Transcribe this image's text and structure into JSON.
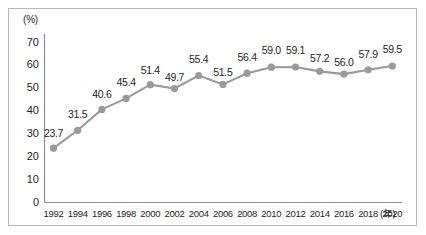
{
  "chart_data": {
    "type": "line",
    "title": "",
    "xlabel": "(年)",
    "ylabel": "(%)",
    "ylim": [
      0,
      70
    ],
    "ytick_labels": [
      "70",
      "60",
      "50",
      "40",
      "30",
      "20",
      "10",
      "0"
    ],
    "ytick_values": [
      70,
      60,
      50,
      40,
      30,
      20,
      10,
      0
    ],
    "grid": false,
    "legend": "none",
    "series_color": "#9a9a9a",
    "categories": [
      "1992",
      "1994",
      "1996",
      "1998",
      "2000",
      "2002",
      "2004",
      "2006",
      "2008",
      "2010",
      "2012",
      "2014",
      "2016",
      "2018",
      "2020"
    ],
    "values": [
      23.7,
      31.5,
      40.6,
      45.4,
      51.4,
      49.7,
      55.4,
      51.5,
      56.4,
      59.0,
      59.1,
      57.2,
      56.0,
      57.9,
      59.5
    ],
    "data_labels": [
      "23.7",
      "31.5",
      "40.6",
      "45.4",
      "51.4",
      "49.7",
      "55.4",
      "51.5",
      "56.4",
      "59.0",
      "59.1",
      "57.2",
      "56.0",
      "57.9",
      "59.5"
    ]
  }
}
